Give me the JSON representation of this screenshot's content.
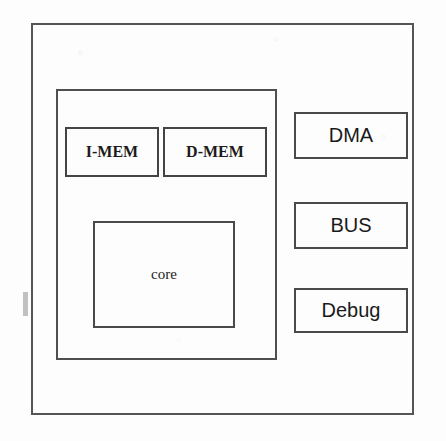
{
  "diagram": {
    "background_color": "#fdfdfd",
    "stroke_color": "#4a4a4a",
    "text_color": "#1c1c1c",
    "outer_frame": {
      "name": "system-boundary"
    },
    "subsystem": {
      "name": "processor-subsystem"
    },
    "blocks": [
      {
        "id": "imem",
        "label": "I-MEM"
      },
      {
        "id": "dmem",
        "label": "D-MEM"
      },
      {
        "id": "core",
        "label": "core"
      },
      {
        "id": "dma",
        "label": "DMA"
      },
      {
        "id": "bus",
        "label": "BUS"
      },
      {
        "id": "debug",
        "label": "Debug"
      }
    ],
    "artifacts": {
      "bleed_line_1": "",
      "bleed_line_2": "",
      "bleed_line_3": "",
      "bleed_line_4": ""
    }
  }
}
